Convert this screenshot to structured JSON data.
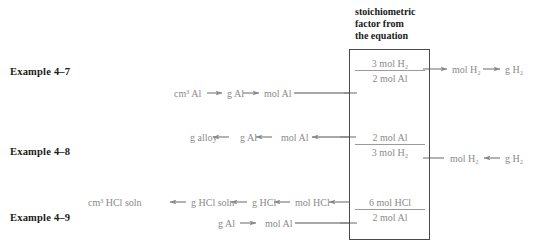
{
  "figure": {
    "box_caption_line1": "stoichiometric",
    "box_caption_line2": "factor from",
    "box_caption_line3": "the equation",
    "box_label_name": "stoichiometric factor from the equation",
    "line_color": "#8a8a8a",
    "box_border_color": "#4a4a4a",
    "text_color": "#8a8a8a",
    "label_color": "#1a1a1a",
    "background": "#ffffff"
  },
  "rows": [
    {
      "label": "Example 4–7",
      "left_chain": [
        "cm³ Al",
        "g Al",
        "mol Al"
      ],
      "left_directions": [
        "right",
        "right"
      ],
      "factor_numerator": "3 mol H₂",
      "factor_denominator": "2 mol Al",
      "right_chain": [
        "mol H₂",
        "g H₂"
      ],
      "right_directions": [
        "right"
      ]
    },
    {
      "label": "Example 4–8",
      "left_chain": [
        "g alloy",
        "g Al",
        "mol Al"
      ],
      "left_directions": [
        "left",
        "left"
      ],
      "factor_numerator": "2 mol Al",
      "factor_denominator": "3 mol H₂",
      "right_chain": [
        "mol H₂",
        "g H₂"
      ],
      "right_directions": [
        "left"
      ]
    },
    {
      "label": "Example 4–9",
      "left_chain": [
        "cm³ HCl soln",
        "g HCl soln",
        "g HCl",
        "mol HCl"
      ],
      "left_directions": [
        "left",
        "left",
        "left"
      ],
      "second_chain": [
        "g Al",
        "mol Al"
      ],
      "second_directions": [
        "right"
      ],
      "factor_numerator": "6 mol HCl",
      "factor_denominator": "2 mol Al",
      "right_chain": [],
      "right_directions": []
    }
  ]
}
